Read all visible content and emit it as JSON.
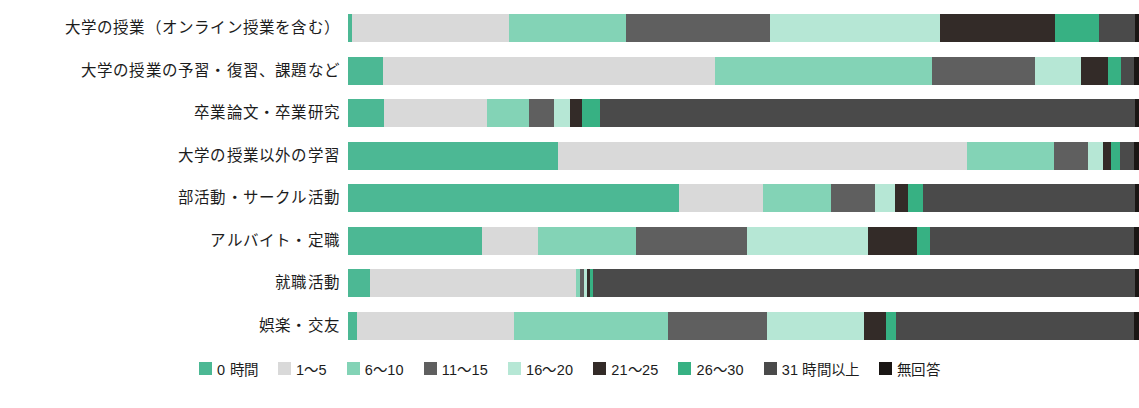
{
  "chart_data": {
    "type": "bar",
    "subtype": "stacked-horizontal-100-percent",
    "title": "",
    "xlabel": "",
    "ylabel": "",
    "grid": false,
    "legend_position": "bottom",
    "xlim": [
      0,
      100
    ],
    "unit_note": "週あたりの時間（時間）",
    "categories": [
      "大学の授業（オンライン授業を含む）",
      "大学の授業の予習・復習、課題など",
      "卒業論文・卒業研究",
      "大学の授業以外の学習",
      "部活動・サークル活動",
      "アルバイト・定職",
      "就職活動",
      "娯楽・交友"
    ],
    "series": [
      {
        "name": "0 時間",
        "color": "#4cb894",
        "values": [
          0.5,
          4.4,
          4.5,
          26.6,
          41.9,
          16.9,
          2.8,
          1.1
        ]
      },
      {
        "name": "1〜5",
        "color": "#d9d9d9",
        "values": [
          19.9,
          42.0,
          13.1,
          51.7,
          10.6,
          7.1,
          26.0,
          19.9
        ]
      },
      {
        "name": "6〜10",
        "color": "#83d3b6",
        "values": [
          14.8,
          27.4,
          5.3,
          10.9,
          8.5,
          12.4,
          0.5,
          19.4
        ]
      },
      {
        "name": "11〜15",
        "color": "#5f5f5f",
        "values": [
          18.1,
          13.0,
          3.2,
          4.4,
          5.6,
          14.1,
          0.5,
          12.6
        ]
      },
      {
        "name": "16〜20",
        "color": "#b6e7d5",
        "values": [
          21.6,
          5.9,
          2.0,
          1.9,
          2.6,
          15.2,
          0.4,
          12.2
        ]
      },
      {
        "name": "21〜25",
        "color": "#332b28",
        "values": [
          14.5,
          3.4,
          1.5,
          1.0,
          1.6,
          6.2,
          0.4,
          2.8
        ]
      },
      {
        "name": "26〜30",
        "color": "#37b183",
        "values": [
          5.5,
          1.6,
          2.3,
          1.1,
          1.9,
          1.7,
          0.4,
          1.3
        ]
      },
      {
        "name": "31 時間以上",
        "color": "#4a4a4a",
        "values": [
          4.6,
          1.7,
          67.6,
          1.8,
          26.8,
          25.8,
          68.5,
          30.1
        ]
      },
      {
        "name": "無回答",
        "color": "#1a1614",
        "values": [
          0.5,
          0.6,
          0.5,
          0.6,
          0.5,
          0.6,
          0.5,
          0.6
        ]
      }
    ]
  },
  "legend": {
    "items": [
      {
        "label": "0 時間",
        "color": "#4cb894"
      },
      {
        "label": "1〜5",
        "color": "#d9d9d9"
      },
      {
        "label": "6〜10",
        "color": "#83d3b6"
      },
      {
        "label": "11〜15",
        "color": "#5f5f5f"
      },
      {
        "label": "16〜20",
        "color": "#b6e7d5"
      },
      {
        "label": "21〜25",
        "color": "#332b28"
      },
      {
        "label": "26〜30",
        "color": "#37b183"
      },
      {
        "label": "31 時間以上",
        "color": "#4a4a4a"
      },
      {
        "label": "無回答",
        "color": "#1a1614"
      }
    ]
  }
}
